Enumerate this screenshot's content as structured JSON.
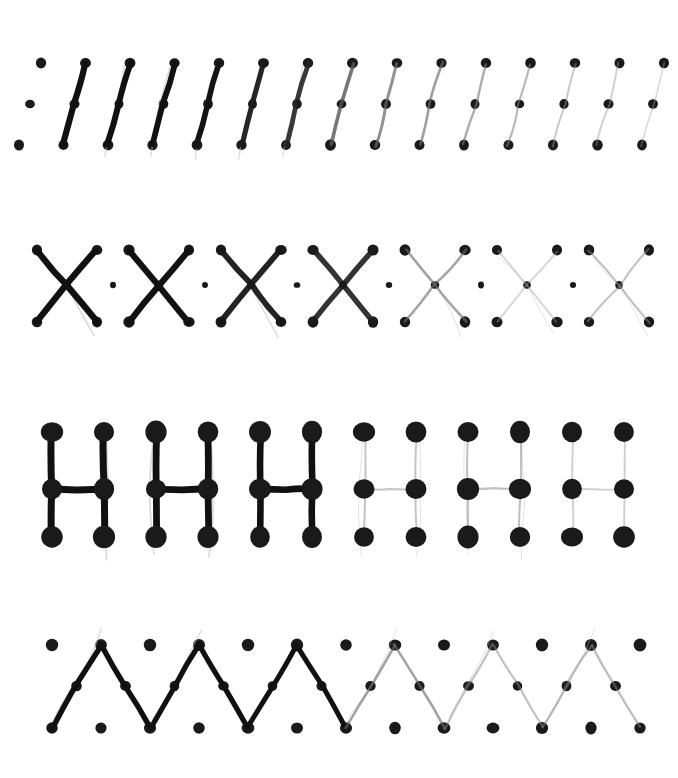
{
  "figure": {
    "width": 678,
    "height": 778,
    "background_color": "#ffffff",
    "dot_color": "#1a1a1a",
    "stroke_dark_color": "#111111",
    "stroke_light_color": "#aaaaaa"
  },
  "chart_data": {
    "type": "scatter",
    "xlabel": "",
    "ylabel": "",
    "grid": false,
    "legend": "none",
    "rows": [
      {
        "name": "row-diagonal-slash",
        "glyph": "slash",
        "label": "Diagonal / strokes",
        "dot_radius": 5.2,
        "grid_y": [
          63,
          104,
          145
        ],
        "grid_x_start": 41,
        "grid_x_step": 44.5,
        "grid_columns": 15,
        "instances": 14,
        "strokes": [
          {
            "index": 0,
            "opacity": 1.0,
            "width": 6.2,
            "color": "#111111",
            "x_offset": 44.5
          },
          {
            "index": 1,
            "opacity": 1.0,
            "width": 6.0,
            "color": "#111111",
            "x_offset": 89.0
          },
          {
            "index": 2,
            "opacity": 1.0,
            "width": 5.8,
            "color": "#111111",
            "x_offset": 133.5
          },
          {
            "index": 3,
            "opacity": 1.0,
            "width": 5.6,
            "color": "#141414",
            "x_offset": 178.0
          },
          {
            "index": 4,
            "opacity": 0.95,
            "width": 5.2,
            "color": "#1a1a1a",
            "x_offset": 222.5
          },
          {
            "index": 5,
            "opacity": 0.9,
            "width": 4.8,
            "color": "#222222",
            "x_offset": 267.0
          },
          {
            "index": 6,
            "opacity": 0.8,
            "width": 3.6,
            "color": "#555555",
            "x_offset": 311.5
          },
          {
            "index": 7,
            "opacity": 0.72,
            "width": 3.0,
            "color": "#666666",
            "x_offset": 356.0
          },
          {
            "index": 8,
            "opacity": 0.66,
            "width": 2.6,
            "color": "#6e6e6e",
            "x_offset": 400.5
          },
          {
            "index": 9,
            "opacity": 0.6,
            "width": 2.4,
            "color": "#777777",
            "x_offset": 445.0
          },
          {
            "index": 10,
            "opacity": 0.55,
            "width": 2.2,
            "color": "#808080",
            "x_offset": 489.5
          },
          {
            "index": 11,
            "opacity": 0.48,
            "width": 2.0,
            "color": "#8c8c8c",
            "x_offset": 534.0
          },
          {
            "index": 12,
            "opacity": 0.44,
            "width": 1.9,
            "color": "#949494",
            "x_offset": 578.5
          },
          {
            "index": 13,
            "opacity": 0.38,
            "width": 1.7,
            "color": "#a0a0a0",
            "x_offset": 623.0
          }
        ]
      },
      {
        "name": "row-x-cross",
        "glyph": "x",
        "label": "X crossing strokes",
        "dot_radius": 5.4,
        "center_dot_radius": 4.0,
        "grid_y": [
          250,
          285,
          322
        ],
        "instances": 7,
        "x_half_width": 30,
        "spacing": 92,
        "first_center_x": 67,
        "separator_dots": 6,
        "strokes": [
          {
            "index": 0,
            "opacity": 1.0,
            "width": 6.4,
            "color": "#111111"
          },
          {
            "index": 1,
            "opacity": 1.0,
            "width": 6.2,
            "color": "#111111"
          },
          {
            "index": 2,
            "opacity": 0.95,
            "width": 5.8,
            "color": "#171717"
          },
          {
            "index": 3,
            "opacity": 0.9,
            "width": 5.4,
            "color": "#1d1d1d"
          },
          {
            "index": 4,
            "opacity": 0.6,
            "width": 2.6,
            "color": "#6b6b6b"
          },
          {
            "index": 5,
            "opacity": 0.42,
            "width": 1.9,
            "color": "#9a9a9a"
          },
          {
            "index": 6,
            "opacity": 0.5,
            "width": 2.1,
            "color": "#888888"
          }
        ]
      },
      {
        "name": "row-h-letter",
        "glyph": "h",
        "label": "Letter H strokes",
        "dot_radius": 10.5,
        "grid_y": [
          432,
          489,
          537
        ],
        "instances": 6,
        "h_width": 52,
        "spacing": 104,
        "first_left_x": 52,
        "strokes": [
          {
            "index": 0,
            "opacity": 1.0,
            "width": 7.0,
            "color": "#111111"
          },
          {
            "index": 1,
            "opacity": 1.0,
            "width": 6.8,
            "color": "#111111"
          },
          {
            "index": 2,
            "opacity": 1.0,
            "width": 6.6,
            "color": "#111111"
          },
          {
            "index": 3,
            "opacity": 0.5,
            "width": 2.0,
            "color": "#8a8a8a"
          },
          {
            "index": 4,
            "opacity": 0.52,
            "width": 2.1,
            "color": "#878787"
          },
          {
            "index": 5,
            "opacity": 0.45,
            "width": 1.9,
            "color": "#949494"
          }
        ]
      },
      {
        "name": "row-zigzag",
        "glyph": "zigzag",
        "label": "Continuous zigzag stroke",
        "dot_radius": 6.0,
        "grid_y": [
          645,
          686,
          728
        ],
        "grid_x_start": 52,
        "grid_x_step": 49,
        "grid_columns": 13,
        "peaks": 6,
        "strokes": [
          {
            "index": 0,
            "opacity": 1.0,
            "width": 5.4,
            "color": "#111111"
          },
          {
            "index": 1,
            "opacity": 1.0,
            "width": 5.2,
            "color": "#111111"
          },
          {
            "index": 2,
            "opacity": 1.0,
            "width": 5.0,
            "color": "#111111"
          },
          {
            "index": 3,
            "opacity": 0.62,
            "width": 2.6,
            "color": "#6a6a6a"
          },
          {
            "index": 4,
            "opacity": 0.5,
            "width": 2.2,
            "color": "#838383"
          },
          {
            "index": 5,
            "opacity": 0.52,
            "width": 2.3,
            "color": "#7f7f7f"
          }
        ]
      }
    ]
  }
}
